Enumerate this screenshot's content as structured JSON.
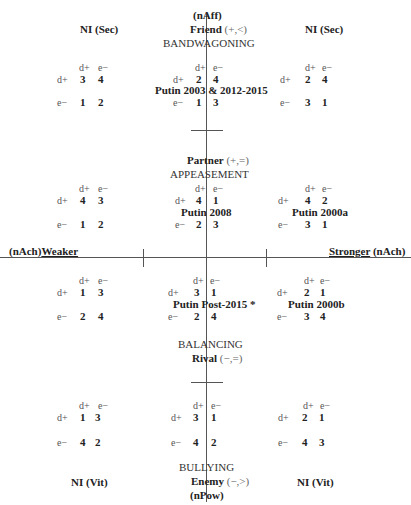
{
  "axes": {
    "top": "(nAff)",
    "bottom": "(nPow)",
    "left_prefix": "(nAch)",
    "left": "Weaker",
    "right": "Stronger",
    "right_suffix": " (nAch)"
  },
  "roles": {
    "friend": {
      "name": "Friend",
      "sign": " (+,<)",
      "strategy": "BANDWAGONING"
    },
    "partner": {
      "name": "Partner",
      "sign": " (+,=)",
      "strategy": "APPEASEMENT"
    },
    "rival": {
      "name": "Rival",
      "sign": " (−,=)",
      "strategy": "BALANCING"
    },
    "enemy": {
      "name": "Enemy",
      "sign": " (−,>)",
      "strategy": "BULLYING"
    }
  },
  "corner_labels": {
    "top_left": "NI (Sec)",
    "top_right": "NI (Sec)",
    "bottom_left": "NI (Vit)",
    "bottom_right": "NI (Vit)"
  },
  "matrix_headers": {
    "col1": "d+",
    "col2": "e−",
    "row1": "d+",
    "row2": "e−"
  },
  "matrices": [
    {
      "id": "r1c1",
      "label": "",
      "values": [
        "3",
        "4",
        "1",
        "2"
      ]
    },
    {
      "id": "r1c2",
      "label": "Putin 2003 & 2012-2015",
      "values": [
        "2",
        "4",
        "1",
        "3"
      ]
    },
    {
      "id": "r1c3",
      "label": "",
      "values": [
        "2",
        "4",
        "3",
        "1"
      ]
    },
    {
      "id": "r2c1",
      "label": "",
      "values": [
        "4",
        "3",
        "1",
        "2"
      ]
    },
    {
      "id": "r2c2",
      "label": "Putin 2008",
      "values": [
        "4",
        "1",
        "2",
        "3"
      ]
    },
    {
      "id": "r2c3",
      "label": "Putin 2000a",
      "values": [
        "4",
        "2",
        "3",
        "1"
      ]
    },
    {
      "id": "r3c1",
      "label": "",
      "values": [
        "1",
        "3",
        "2",
        "4"
      ]
    },
    {
      "id": "r3c2",
      "label": "Putin Post-2015 *",
      "values": [
        "3",
        "1",
        "2",
        "4"
      ]
    },
    {
      "id": "r3c3",
      "label": "Putin 2000b",
      "values": [
        "2",
        "1",
        "3",
        "4"
      ]
    },
    {
      "id": "r4c1",
      "label": "",
      "values": [
        "1",
        "3",
        "4",
        "2"
      ]
    },
    {
      "id": "r4c2",
      "label": "",
      "values": [
        "3",
        "1",
        "4",
        "2"
      ]
    },
    {
      "id": "r4c3",
      "label": "",
      "values": [
        "2",
        "1",
        "4",
        "3"
      ]
    }
  ]
}
